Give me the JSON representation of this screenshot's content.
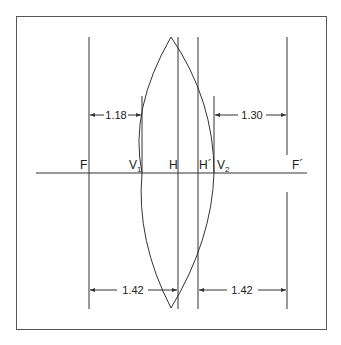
{
  "diagram": {
    "type": "thick-lens-cardinal-points",
    "colors": {
      "line": "#333333",
      "frame": "#555555",
      "background": "#ffffff"
    },
    "axis_labels": {
      "F": "F",
      "V1": "V",
      "V1_sub": "1",
      "H": "H",
      "H_prime": "H´",
      "V2": "V",
      "V2_sub": "2",
      "F_prime": "F´"
    },
    "dimensions": {
      "front_focal_distance": "1.18",
      "back_focal_distance": "1.30",
      "front_focal_length": "1.42",
      "back_focal_length": "1.42"
    }
  }
}
